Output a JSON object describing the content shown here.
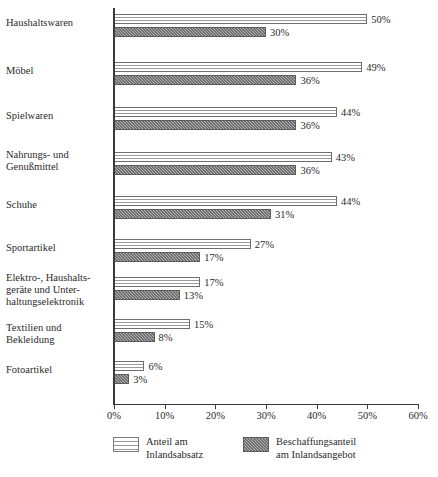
{
  "chart_data": {
    "type": "bar",
    "orientation": "horizontal",
    "title": "",
    "xlabel": "",
    "ylabel": "",
    "xlim": [
      0,
      60
    ],
    "xtick_labels": [
      "0%",
      "10%",
      "20%",
      "30%",
      "40%",
      "50%",
      "60%"
    ],
    "xticks": [
      0,
      10,
      20,
      30,
      40,
      50,
      60
    ],
    "grid": false,
    "legend_position": "bottom",
    "categories": [
      "Haushaltswaren",
      "Möbel",
      "Spielwaren",
      "Nahrungs- und\nGenußmittel",
      "Schuhe",
      "Sportartikel",
      "Elektro-, Haushalts-\ngeräte und Unter-\nhaltungselektronik",
      "Textilien und\nBekleidung",
      "Fotoartikel"
    ],
    "series": [
      {
        "name": "Anteil am\nInlandsabsatz",
        "pattern": "horizontal-lines",
        "values": [
          50,
          49,
          44,
          43,
          44,
          27,
          17,
          15,
          6
        ],
        "value_labels": [
          "50%",
          "49%",
          "44%",
          "43%",
          "44%",
          "27%",
          "17%",
          "15%",
          "6%"
        ]
      },
      {
        "name": "Beschaffungsanteil\nam Inlandsangebot",
        "pattern": "checkered-gray",
        "values": [
          30,
          36,
          36,
          36,
          31,
          17,
          13,
          8,
          3
        ],
        "value_labels": [
          "30%",
          "36%",
          "36%",
          "36%",
          "31%",
          "17%",
          "13%",
          "8%",
          "3%"
        ]
      }
    ]
  },
  "colors": {
    "axis": "#3a3a3a",
    "text": "#2b2b2b",
    "series_a_fill": "#ffffff",
    "series_a_line": "#9a9a9a",
    "series_b_fill": "#8d8d8d",
    "series_b_line": "#5c5c5c"
  }
}
